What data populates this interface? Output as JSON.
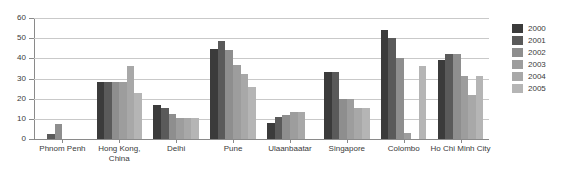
{
  "chart_data": {
    "type": "bar",
    "title": "",
    "subtitle": "",
    "xlabel": "",
    "ylabel": "",
    "ylim": [
      0,
      60
    ],
    "yticks": [
      0,
      10,
      20,
      30,
      40,
      50,
      60
    ],
    "ytick_labels": [
      "0",
      "10",
      "20",
      "30",
      "40",
      "50",
      "60"
    ],
    "grid": true,
    "legend_position": "right",
    "categories": [
      "Phnom Penh",
      "Hong Kong,\nChina",
      "Delhi",
      "Pune",
      "Ulaanbaatar",
      "Singapore",
      "Colombo",
      "Ho Chi Minh City"
    ],
    "series": [
      {
        "name": "2000",
        "color": "#3b3b3b",
        "values": [
          null,
          28.5,
          17.0,
          44.5,
          8.0,
          33.0,
          54.0,
          39.0
        ]
      },
      {
        "name": "2001",
        "color": "#5a5a5a",
        "values": [
          2.5,
          28.5,
          15.5,
          48.5,
          11.0,
          33.0,
          50.0,
          42.0
        ]
      },
      {
        "name": "2002",
        "color": "#8e8e8e",
        "values": [
          7.5,
          28.5,
          12.5,
          44.0,
          12.0,
          20.0,
          40.0,
          42.0
        ]
      },
      {
        "name": "2003",
        "color": "#9d9d9d",
        "values": [
          null,
          28.5,
          10.5,
          36.5,
          13.5,
          20.0,
          3.0,
          31.0
        ]
      },
      {
        "name": "2004",
        "color": "#a8a8a8",
        "values": [
          null,
          36.0,
          10.5,
          32.0,
          13.5,
          15.5,
          null,
          22.0
        ]
      },
      {
        "name": "2005",
        "color": "#b5b5b5",
        "values": [
          null,
          23.0,
          10.5,
          26.0,
          null,
          15.5,
          36.0,
          31.0
        ]
      }
    ]
  },
  "legend": {
    "items": [
      {
        "label": "2000",
        "color": "#3b3b3b"
      },
      {
        "label": "2001",
        "color": "#5a5a5a"
      },
      {
        "label": "2002",
        "color": "#8e8e8e"
      },
      {
        "label": "2003",
        "color": "#9d9d9d"
      },
      {
        "label": "2004",
        "color": "#a8a8a8"
      },
      {
        "label": "2005",
        "color": "#b5b5b5"
      }
    ]
  },
  "axis": {
    "y_tick_labels": [
      "60",
      "50",
      "40",
      "30",
      "20",
      "10",
      "0"
    ]
  }
}
